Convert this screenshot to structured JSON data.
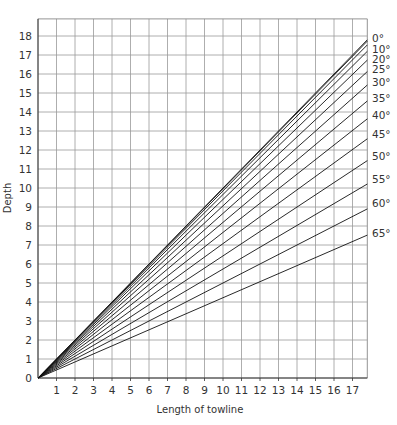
{
  "chart_data": {
    "type": "line",
    "title": "",
    "xlabel": "Length of towline",
    "ylabel": "Depth",
    "xlim": [
      0,
      17.8
    ],
    "ylim": [
      0,
      18.9
    ],
    "x_ticks": [
      1,
      2,
      3,
      4,
      5,
      6,
      7,
      8,
      9,
      10,
      11,
      12,
      13,
      14,
      15,
      16,
      17
    ],
    "y_ticks": [
      0,
      1,
      2,
      3,
      4,
      5,
      6,
      7,
      8,
      9,
      10,
      11,
      12,
      13,
      14,
      15,
      16,
      17,
      18
    ],
    "grid": true,
    "legend_position": "right-edge line labels",
    "relation": "depth = length × cos(angle)",
    "series": [
      {
        "name": "0°",
        "angle": 0,
        "x": [
          0,
          17.8
        ],
        "y": [
          0,
          17.8
        ]
      },
      {
        "name": "10°",
        "angle": 10,
        "x": [
          0,
          17.8
        ],
        "y": [
          0,
          17.53
        ]
      },
      {
        "name": "20°",
        "angle": 20,
        "x": [
          0,
          17.8
        ],
        "y": [
          0,
          16.73
        ]
      },
      {
        "name": "25°",
        "angle": 25,
        "x": [
          0,
          17.8
        ],
        "y": [
          0,
          16.13
        ]
      },
      {
        "name": "30°",
        "angle": 30,
        "x": [
          0,
          17.8
        ],
        "y": [
          0,
          15.42
        ]
      },
      {
        "name": "35°",
        "angle": 35,
        "x": [
          0,
          17.8
        ],
        "y": [
          0,
          14.58
        ]
      },
      {
        "name": "40°",
        "angle": 40,
        "x": [
          0,
          17.8
        ],
        "y": [
          0,
          13.64
        ]
      },
      {
        "name": "45°",
        "angle": 45,
        "x": [
          0,
          17.8
        ],
        "y": [
          0,
          12.59
        ]
      },
      {
        "name": "50°",
        "angle": 50,
        "x": [
          0,
          17.8
        ],
        "y": [
          0,
          11.44
        ]
      },
      {
        "name": "55°",
        "angle": 55,
        "x": [
          0,
          17.8
        ],
        "y": [
          0,
          10.21
        ]
      },
      {
        "name": "60°",
        "angle": 60,
        "x": [
          0,
          17.8
        ],
        "y": [
          0,
          8.9
        ]
      },
      {
        "name": "65°",
        "angle": 65,
        "x": [
          0,
          17.8
        ],
        "y": [
          0,
          7.52
        ]
      }
    ],
    "extra_lines": [
      15,
      5
    ]
  },
  "labels": {
    "xlabel": "Length of towline",
    "ylabel": "Depth"
  }
}
